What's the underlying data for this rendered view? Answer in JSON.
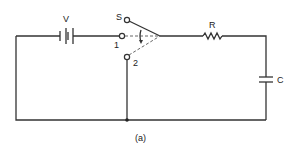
{
  "diagram": {
    "type": "circuit",
    "caption": "(a)",
    "components": {
      "battery": {
        "label": "V"
      },
      "switch": {
        "label": "S",
        "terminal_1": "1",
        "terminal_2": "2"
      },
      "resistor": {
        "label": "R"
      },
      "capacitor": {
        "label": "C"
      }
    }
  }
}
